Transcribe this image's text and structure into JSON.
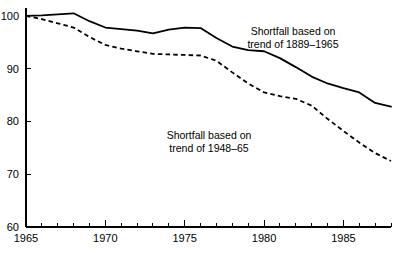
{
  "chart_data": {
    "type": "line",
    "title": "",
    "xlabel": "",
    "ylabel": "",
    "xlim": [
      1965,
      1988
    ],
    "ylim": [
      60,
      101.5
    ],
    "grid": false,
    "legend_position": "inline-annotations",
    "y_ticks": [
      60,
      70,
      80,
      90,
      100
    ],
    "y_tick_labels": [
      "60",
      "70",
      "80",
      "90",
      "100"
    ],
    "x_ticks": [
      1965,
      1966,
      1967,
      1968,
      1969,
      1970,
      1971,
      1972,
      1973,
      1974,
      1975,
      1976,
      1977,
      1978,
      1979,
      1980,
      1981,
      1982,
      1983,
      1984,
      1985,
      1986,
      1987,
      1988
    ],
    "x_tick_labels": [
      "1965",
      "1970",
      "1975",
      "1980",
      "1985"
    ],
    "x_labeled_ticks": [
      1965,
      1970,
      1975,
      1980,
      1985
    ],
    "x": [
      1965,
      1966,
      1967,
      1968,
      1969,
      1970,
      1971,
      1972,
      1973,
      1974,
      1975,
      1976,
      1977,
      1978,
      1979,
      1980,
      1981,
      1982,
      1983,
      1984,
      1985,
      1986,
      1987,
      1988
    ],
    "series": [
      {
        "name": "Shortfall based on trend of 1889-1965",
        "style": "solid",
        "values": [
          100.0,
          100.1,
          100.3,
          100.5,
          99.0,
          97.8,
          97.5,
          97.2,
          96.7,
          97.4,
          97.8,
          97.7,
          95.8,
          94.2,
          93.5,
          93.3,
          92.0,
          90.3,
          88.5,
          87.2,
          86.3,
          85.5,
          83.5,
          82.8
        ],
        "annotation": "Shortfall based on\ntrend of 1889–1965"
      },
      {
        "name": "Shortfall based on trend of 1948-65",
        "style": "dashed",
        "values": [
          100.0,
          99.4,
          98.6,
          97.8,
          96.0,
          94.5,
          93.8,
          93.3,
          92.8,
          92.7,
          92.6,
          92.5,
          91.5,
          89.3,
          87.2,
          85.5,
          84.8,
          84.3,
          83.0,
          80.5,
          78.2,
          76.0,
          74.0,
          72.5
        ]
      }
    ],
    "annotations": [
      {
        "name": "annotation-trend-1889-1965",
        "line1": "Shortfall based on",
        "line2": "trend of 1889–1965",
        "x_px": 293,
        "y_px": 35
      },
      {
        "name": "annotation-trend-1948-65",
        "line1": "Shortfall based on",
        "line2": "trend of 1948–65",
        "x_px": 209,
        "y_px": 139
      }
    ]
  }
}
